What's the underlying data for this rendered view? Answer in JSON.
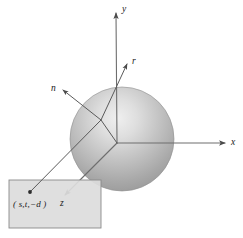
{
  "figure": {
    "background_color": "#ffffff",
    "line_color": "#595959",
    "label_color": "#1a1a1a"
  },
  "axes": {
    "origin": {
      "x": 117,
      "y": 143
    },
    "items": [
      {
        "name": "y-axis",
        "label": "y",
        "label_x": 122,
        "label_y": 5,
        "from": {
          "x": 117,
          "y": 143
        },
        "to": {
          "x": 116,
          "y": 13
        },
        "arrow": true
      },
      {
        "name": "x-axis",
        "label": "x",
        "label_x": 231,
        "label_y": 138,
        "from": {
          "x": 117,
          "y": 143
        },
        "to": {
          "x": 225,
          "y": 143
        },
        "arrow": true
      },
      {
        "name": "z-axis",
        "label": "z",
        "label_x": 60,
        "label_y": 199,
        "from": {
          "x": 117,
          "y": 143
        },
        "to": {
          "x": 65,
          "y": 195
        },
        "arrow": true
      }
    ]
  },
  "sphere": {
    "name": "sphere",
    "center_x": 122,
    "center_y": 139,
    "radius": 52,
    "highlight_x": 145,
    "highlight_y": 108,
    "color_light": "#e8e8e8",
    "color_mid": "#b9b9b9",
    "color_dark": "#8f8f8f",
    "outline_color": "#8a8a8a"
  },
  "view_plane": {
    "name": "view-plane",
    "x": 9,
    "y": 180,
    "width": 92,
    "height": 48,
    "fill": "#dcdcdc",
    "stroke": "#8a8a8a"
  },
  "hit_point": {
    "name": "surface-hit-point",
    "x": 101,
    "y": 120
  },
  "pixel_point": {
    "name": "view-plane-sample-point",
    "label": "( s,t,−d )",
    "label_x": 13,
    "label_y": 200,
    "dot_x": 30,
    "dot_y": 192
  },
  "vectors": [
    {
      "name": "normal-vector",
      "label": "n",
      "label_x": 51,
      "label_y": 84,
      "from": {
        "x": 101,
        "y": 120
      },
      "to": {
        "x": 63,
        "y": 90
      },
      "arrow": true
    },
    {
      "name": "reflected-ray",
      "label": "r",
      "label_x": 132,
      "label_y": 57,
      "from": {
        "x": 101,
        "y": 120
      },
      "to": {
        "x": 127,
        "y": 64
      },
      "arrow": true
    },
    {
      "name": "eye-ray",
      "label": "",
      "from": {
        "x": 30,
        "y": 192
      },
      "to": {
        "x": 101,
        "y": 120
      },
      "arrow": false
    },
    {
      "name": "eye-ray-extension",
      "label": "",
      "from": {
        "x": 101,
        "y": 120
      },
      "to": {
        "x": 117,
        "y": 143
      },
      "arrow": false
    }
  ]
}
